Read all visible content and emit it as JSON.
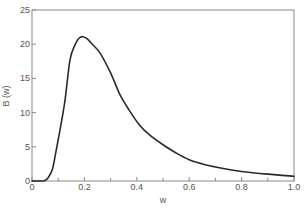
{
  "chart_data": {
    "type": "line",
    "title": "",
    "xlabel": "w",
    "ylabel": "B (w)",
    "xlim": [
      0,
      1.0
    ],
    "ylim": [
      0,
      25
    ],
    "grid": false,
    "legend": null,
    "x_ticks": [
      "0",
      "0.2",
      "0.4",
      "0.6",
      "0.8",
      "1.0"
    ],
    "x_minor_ticks": [
      0.1,
      0.3,
      0.5,
      0.7,
      0.9
    ],
    "y_ticks": [
      "0",
      "5",
      "10",
      "15",
      "20",
      "25"
    ],
    "series": [
      {
        "name": "B(w)",
        "color": "#2a2a2a",
        "x": [
          0.0,
          0.04,
          0.05,
          0.06,
          0.077,
          0.09,
          0.107,
          0.126,
          0.145,
          0.164,
          0.18,
          0.195,
          0.21,
          0.23,
          0.26,
          0.3,
          0.336,
          0.37,
          0.41,
          0.45,
          0.5,
          0.55,
          0.6,
          0.65,
          0.72,
          0.8,
          0.9,
          1.0
        ],
        "values": [
          0.0,
          0.0,
          0.1,
          0.4,
          1.6,
          4.0,
          7.5,
          11.8,
          17.7,
          19.9,
          20.9,
          21.1,
          20.8,
          20.0,
          18.7,
          15.8,
          12.6,
          10.4,
          8.2,
          6.7,
          5.3,
          4.1,
          3.1,
          2.5,
          1.9,
          1.4,
          1.0,
          0.7
        ]
      }
    ]
  },
  "axes": {
    "axis_color": "#8a8a8a",
    "label_color": "#555555"
  }
}
